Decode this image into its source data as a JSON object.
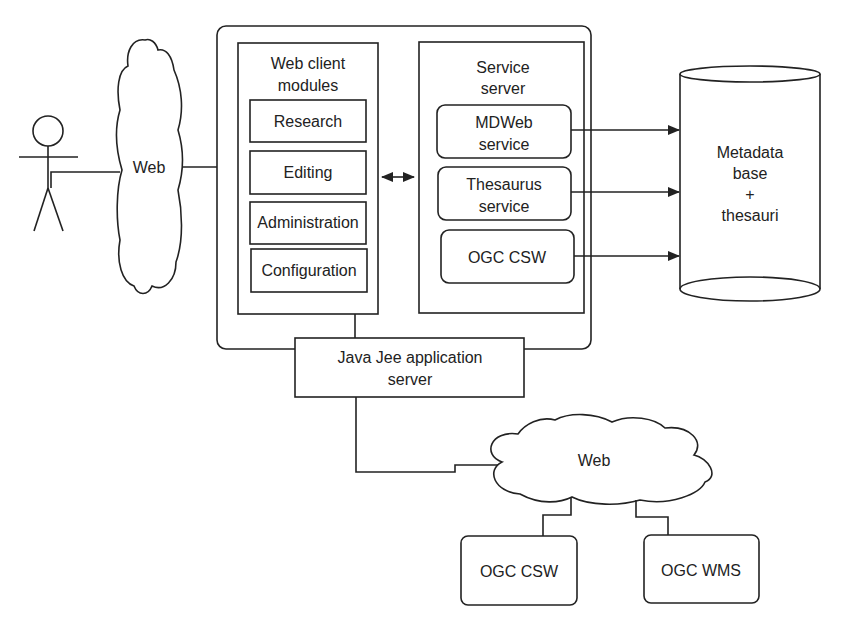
{
  "actor": {
    "label": ""
  },
  "clouds": {
    "left": {
      "label": "Web"
    },
    "bottom": {
      "label": "Web"
    }
  },
  "web_client": {
    "title_line1": "Web client",
    "title_line2": "modules",
    "modules": [
      {
        "label": "Research"
      },
      {
        "label": "Editing"
      },
      {
        "label": "Administration"
      },
      {
        "label": "Configuration"
      }
    ]
  },
  "service_server": {
    "title_line1": "Service",
    "title_line2": "server",
    "services": [
      {
        "line1": "MDWeb",
        "line2": "service"
      },
      {
        "line1": "Thesaurus",
        "line2": "service"
      },
      {
        "line1": "OGC CSW",
        "line2": ""
      }
    ]
  },
  "database": {
    "line1": "Metadata",
    "line2": "base",
    "line3": "+",
    "line4": "thesauri"
  },
  "app_server": {
    "line1": "Java Jee application",
    "line2": "server"
  },
  "external_services": [
    {
      "label": "OGC CSW"
    },
    {
      "label": "OGC WMS"
    }
  ],
  "colors": {
    "stroke": "#222222",
    "background": "#ffffff"
  }
}
